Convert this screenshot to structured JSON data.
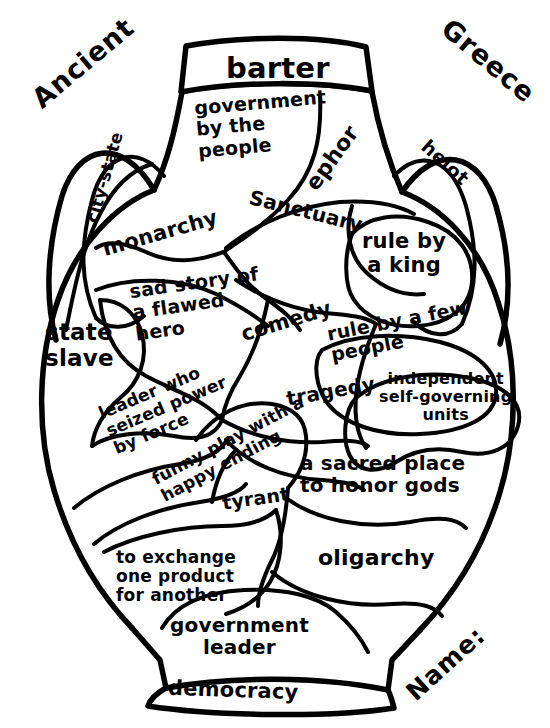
{
  "worksheet": {
    "title_left": "Ancient",
    "title_right": "Greece",
    "name_field_label": "Name:",
    "shape": "greek-vase-amphora",
    "ink_color": "#000000",
    "background_color": "#ffffff"
  },
  "terms": [
    {
      "id": "barter",
      "text": "barter",
      "kind": "term"
    },
    {
      "id": "government-by-the-people",
      "text": "government\nby the\npeople",
      "kind": "definition"
    },
    {
      "id": "ephor",
      "text": "ephor",
      "kind": "term"
    },
    {
      "id": "city-state",
      "text": "city-state",
      "kind": "term"
    },
    {
      "id": "helot",
      "text": "helot",
      "kind": "term"
    },
    {
      "id": "monarchy",
      "text": "monarchy",
      "kind": "term"
    },
    {
      "id": "sanctuary",
      "text": "Sanctuary",
      "kind": "term"
    },
    {
      "id": "rule-by-a-king",
      "text": "rule by\na king",
      "kind": "definition"
    },
    {
      "id": "sad-story",
      "text": "sad story of\na flawed\nhero",
      "kind": "definition"
    },
    {
      "id": "state-slave",
      "text": "state\nslave",
      "kind": "definition"
    },
    {
      "id": "comedy",
      "text": "comedy",
      "kind": "term"
    },
    {
      "id": "rule-by-a-few",
      "text": "rule by a few\npeople",
      "kind": "definition"
    },
    {
      "id": "tragedy",
      "text": "tragedy",
      "kind": "term"
    },
    {
      "id": "independent-units",
      "text": "independent\nself-governing\nunits",
      "kind": "definition"
    },
    {
      "id": "leader-seized-power",
      "text": "leader who\nseized power\nby force",
      "kind": "definition"
    },
    {
      "id": "funny-play",
      "text": "funny play with a\nhappy ending",
      "kind": "definition"
    },
    {
      "id": "tyrant",
      "text": "tyrant",
      "kind": "term"
    },
    {
      "id": "sacred-place",
      "text": "a sacred place\nto honor gods",
      "kind": "definition"
    },
    {
      "id": "to-exchange",
      "text": "to exchange\none product\nfor another",
      "kind": "definition"
    },
    {
      "id": "oligarchy",
      "text": "oligarchy",
      "kind": "term"
    },
    {
      "id": "government-leader",
      "text": "government\nleader",
      "kind": "definition"
    },
    {
      "id": "democracy",
      "text": "democracy",
      "kind": "term"
    }
  ]
}
